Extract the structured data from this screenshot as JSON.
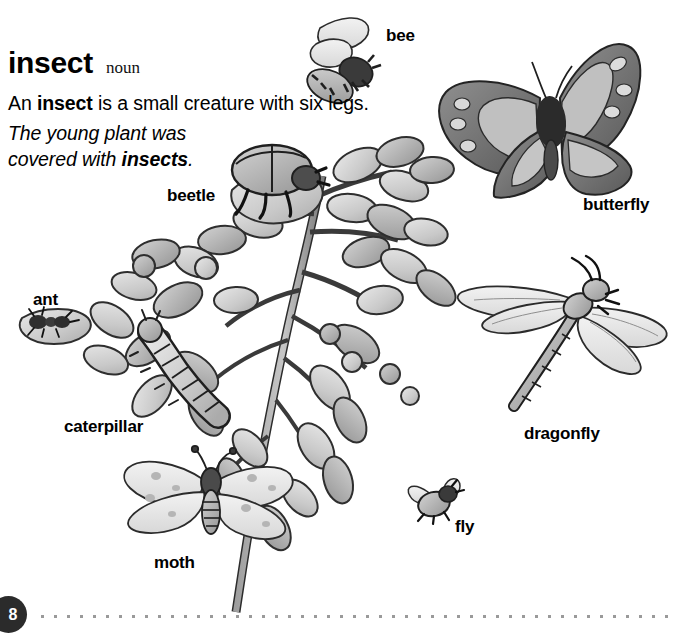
{
  "entry": {
    "headword": "insect",
    "part_of_speech": "noun",
    "definition_prefix": "An ",
    "definition_keyword": "insect",
    "definition_suffix": " is a small creature with six legs.",
    "example_line1": "The young plant was",
    "example_line2_prefix": "covered with ",
    "example_line2_keyword": "insects",
    "example_line2_suffix": "."
  },
  "labels": [
    {
      "id": "bee",
      "text": "bee",
      "x": 386,
      "y": 27
    },
    {
      "id": "butterfly",
      "text": "butterfly",
      "x": 583,
      "y": 196
    },
    {
      "id": "beetle",
      "text": "beetle",
      "x": 167,
      "y": 187
    },
    {
      "id": "ant",
      "text": "ant",
      "x": 33,
      "y": 291
    },
    {
      "id": "caterpillar",
      "text": "caterpillar",
      "x": 64,
      "y": 418
    },
    {
      "id": "dragonfly",
      "text": "dragonfly",
      "x": 524,
      "y": 425
    },
    {
      "id": "moth",
      "text": "moth",
      "x": 154,
      "y": 554
    },
    {
      "id": "fly",
      "text": "fly",
      "x": 455,
      "y": 518
    }
  ],
  "illustration": {
    "alt": "Grayscale watercolor illustration of a leafy plant stem surrounded by eight insects",
    "subjects": [
      "bee",
      "butterfly",
      "beetle",
      "ant",
      "caterpillar",
      "dragonfly",
      "moth",
      "fly",
      "plant-stem"
    ]
  },
  "footer": {
    "page_number": "8"
  },
  "colors": {
    "text": "#000000",
    "page_badge_bg": "#2b2b2b",
    "page_badge_text": "#ffffff",
    "dot_rule": "#9a9a9a",
    "ink": "#1a1a1a",
    "wash_light": "#dcdcdc",
    "wash_mid": "#b4b4b4",
    "wash_dark": "#8a8a8a",
    "wash_deep": "#5e5e5e"
  }
}
